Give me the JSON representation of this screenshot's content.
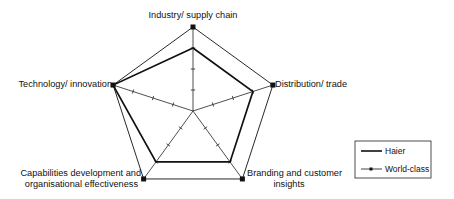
{
  "chart_data": {
    "type": "radar",
    "title": "",
    "axes": [
      {
        "label_lines": [
          "Industry/ supply chain"
        ]
      },
      {
        "label_lines": [
          "Distribution/ trade"
        ]
      },
      {
        "label_lines": [
          "Branding and customer",
          "insights"
        ]
      },
      {
        "label_lines": [
          "Capabilities development and",
          "organisational effectiveness"
        ]
      },
      {
        "label_lines": [
          "Technology/ innovation"
        ]
      }
    ],
    "categories": [
      "Industry/ supply chain",
      "Distribution/ trade",
      "Branding and customer insights",
      "Capabilities development and organisational effectiveness",
      "Technology/ innovation"
    ],
    "range": [
      0,
      4
    ],
    "ticks": [
      1,
      2,
      3,
      4
    ],
    "grid": false,
    "series": [
      {
        "name": "Haier",
        "values": [
          3,
          3,
          3,
          3,
          4
        ],
        "marker": "none",
        "line": "thick",
        "color": "#111111"
      },
      {
        "name": "World-class",
        "values": [
          4,
          4,
          4,
          4,
          4
        ],
        "marker": "square",
        "line": "thin",
        "color": "#111111"
      }
    ],
    "legend": {
      "position": "right",
      "entries": [
        "Haier",
        "World-class"
      ]
    }
  }
}
